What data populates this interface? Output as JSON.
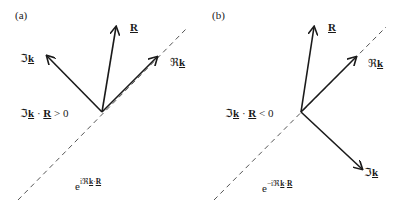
{
  "figure": {
    "panels": [
      {
        "tag": "(a)",
        "vectors": {
          "im_k": {
            "label_prefix": "ℑ",
            "label_var": "k"
          },
          "R": {
            "label": "R"
          },
          "re_k": {
            "label_prefix": "ℜ",
            "label_var": "k"
          }
        },
        "condition": {
          "prefix": "ℑ",
          "k": "k",
          "dot": " · ",
          "R": "R",
          "rel": " > 0"
        },
        "wave": {
          "base": "e",
          "exp_sign": "i",
          "exp_re": "ℜ",
          "exp_k": "k",
          "exp_dot": "·",
          "exp_R": "R"
        }
      },
      {
        "tag": "(b)",
        "vectors": {
          "R": {
            "label": "R"
          },
          "re_k": {
            "label_prefix": "ℜ",
            "label_var": "k"
          },
          "im_k": {
            "label_prefix": "ℑ",
            "label_var": "k"
          }
        },
        "condition": {
          "prefix": "ℑ",
          "k": "k",
          "dot": " · ",
          "R": "R",
          "rel": " < 0"
        },
        "wave": {
          "base": "e",
          "exp_sign": "−i",
          "exp_re": "ℜ",
          "exp_k": "k",
          "exp_dot": "·",
          "exp_R": "R"
        }
      }
    ],
    "colors": {
      "stroke": "#1a1a1a",
      "dashed": "#555555",
      "background": "#ffffff"
    }
  }
}
